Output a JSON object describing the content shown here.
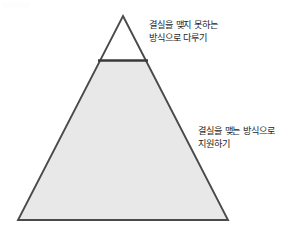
{
  "figure": {
    "type": "pyramid-diagram",
    "background_color": "#ffffff",
    "outline_color": "#4a4a4a",
    "divider_color": "#3a3a3a",
    "text_color": "#1c1c1c",
    "apex": {
      "x": 123,
      "y": 16
    },
    "base_left": {
      "x": 18,
      "y": 220
    },
    "base_right": {
      "x": 228,
      "y": 220
    },
    "divider": {
      "y": 60,
      "x_start": 98,
      "x_end": 148
    },
    "sections": [
      {
        "name": "top-section",
        "fill_color": "#ffffff",
        "label": {
          "lines": [
            "결실을 맺지 못하는",
            "방식으로 다루기"
          ]
        }
      },
      {
        "name": "bottom-section",
        "fill_color": "#e8e8e8",
        "label": {
          "lines": [
            "결실을 맺는 방식으로",
            "지원하기"
          ]
        }
      }
    ]
  }
}
